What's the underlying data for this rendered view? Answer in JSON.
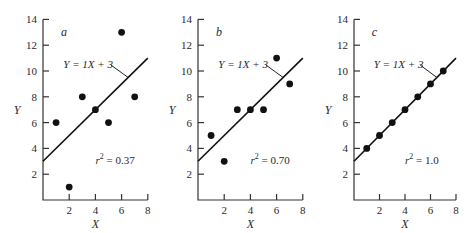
{
  "chart_data": [
    {
      "type": "scatter",
      "panel": "a",
      "x": [
        1,
        2,
        3,
        4,
        5,
        6,
        7
      ],
      "y": [
        6,
        1,
        8,
        7,
        6,
        13,
        8
      ],
      "fit_line": {
        "slope": 1,
        "intercept": 3,
        "label": "Y = 1X + 3"
      },
      "annotation": "r² = 0.37",
      "r2": 0.37,
      "xlabel": "X",
      "ylabel": "Y",
      "xticks": [
        2,
        4,
        6,
        8
      ],
      "yticks": [
        2,
        4,
        6,
        8,
        10,
        12,
        14
      ],
      "xlim": [
        0,
        8
      ],
      "ylim": [
        0,
        14
      ],
      "grid": false
    },
    {
      "type": "scatter",
      "panel": "b",
      "x": [
        1,
        2,
        3,
        4,
        5,
        6,
        7
      ],
      "y": [
        5,
        3,
        7,
        7,
        7,
        11,
        9
      ],
      "fit_line": {
        "slope": 1,
        "intercept": 3,
        "label": "Y = 1X + 3"
      },
      "annotation": "r² = 0.70",
      "r2": 0.7,
      "xlabel": "X",
      "ylabel": "Y",
      "xticks": [
        2,
        4,
        6,
        8
      ],
      "yticks": [
        2,
        4,
        6,
        8,
        10,
        12,
        14
      ],
      "xlim": [
        0,
        8
      ],
      "ylim": [
        0,
        14
      ],
      "grid": false
    },
    {
      "type": "scatter",
      "panel": "c",
      "x": [
        1,
        2,
        3,
        4,
        5,
        6,
        7
      ],
      "y": [
        4,
        5,
        6,
        7,
        8,
        9,
        10
      ],
      "fit_line": {
        "slope": 1,
        "intercept": 3,
        "label": "Y = 1X + 3"
      },
      "annotation": "r² = 1.0",
      "r2": 1.0,
      "xlabel": "X",
      "ylabel": "Y",
      "xticks": [
        2,
        4,
        6,
        8
      ],
      "yticks": [
        2,
        4,
        6,
        8,
        10,
        12,
        14
      ],
      "xlim": [
        0,
        8
      ],
      "ylim": [
        0,
        14
      ],
      "grid": false
    }
  ],
  "panels": [
    {
      "letter": "a",
      "equation": "Y = 1X + 3",
      "r2_prefix": "r",
      "r2_sup": "2",
      "r2_value": " = 0.37",
      "xlabel": "X",
      "ylabel": "Y"
    },
    {
      "letter": "b",
      "equation": "Y = 1X + 3",
      "r2_prefix": "r",
      "r2_sup": "2",
      "r2_value": " = 0.70",
      "xlabel": "X",
      "ylabel": "Y"
    },
    {
      "letter": "c",
      "equation": "Y = 1X + 3",
      "r2_prefix": "r",
      "r2_sup": "2",
      "r2_value": " = 1.0",
      "xlabel": "X",
      "ylabel": "Y"
    }
  ],
  "colors": {
    "ink": "#111111",
    "background": "#ffffff"
  }
}
